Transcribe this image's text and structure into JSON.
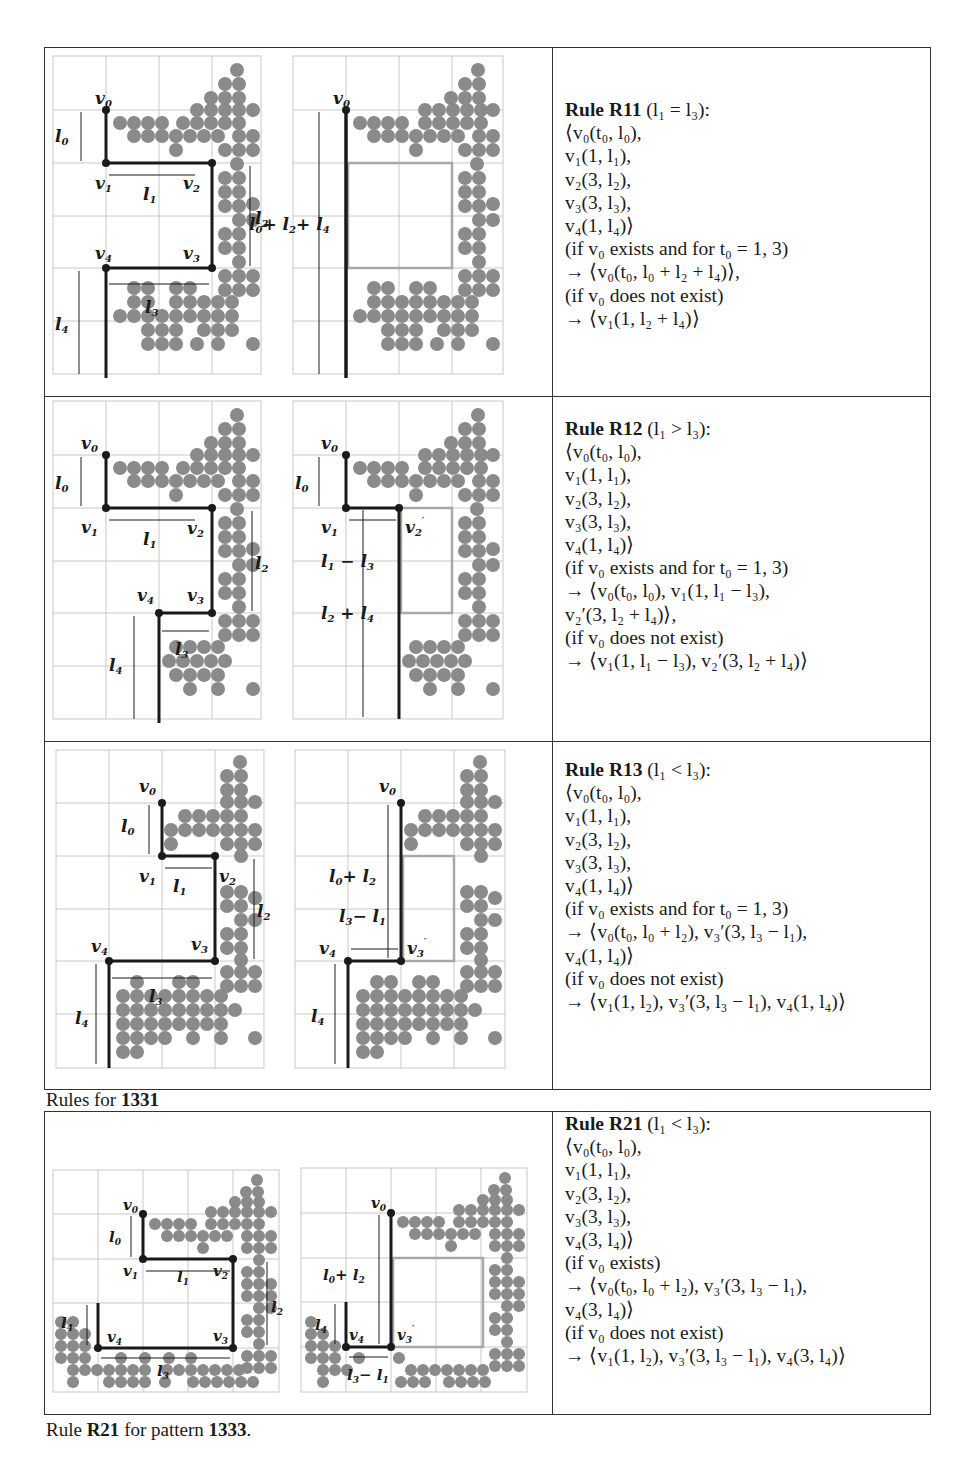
{
  "table1": {
    "caption_prefix": "Rules for ",
    "caption_pattern": "1331",
    "rows": [
      {
        "rule_name": "Rule R11",
        "condition": "(l₁ = l₃):",
        "lines": [
          "⟨v₀(t₀, l₀),",
          "v₁(1, l₁),",
          "v₂(3, l₂),",
          "v₃(3, l₃),",
          "v₄(1, l₄)⟩",
          "(if v₀ exists and for t₀ = 1, 3)",
          "→ ⟨v₀(t₀, l₀ + l₂ + l₄)⟩,",
          "(if v₀ does not exist)",
          "→ ⟨v₁(1, l₂ + l₄)⟩"
        ],
        "figure_left_labels": [
          "v0",
          "l0",
          "v1",
          "l1",
          "v2",
          "l2",
          "v3",
          "v4",
          "l3",
          "l4"
        ],
        "figure_right_labels": [
          "v0",
          "l0+l2+l4"
        ]
      },
      {
        "rule_name": "Rule R12",
        "condition": "(l₁ > l₃):",
        "lines": [
          "⟨v₀(t₀, l₀),",
          "v₁(1, l₁),",
          "v₂(3, l₂),",
          "v₃(3, l₃),",
          "v₄(1, l₄)⟩",
          "(if v₀ exists and for t₀ = 1, 3)",
          "→ ⟨v₀(t₀, l₀), v₁(1, l₁ − l₃),",
          "v₂′(3, l₂ + l₄)⟩,",
          "(if v₀ does not exist)",
          "→ ⟨v₁(1, l₁ − l₃), v₂′(3, l₂ + l₄)⟩"
        ],
        "figure_left_labels": [
          "v0",
          "l0",
          "v1",
          "l1",
          "v2",
          "l2",
          "v4",
          "v3",
          "l3",
          "l4"
        ],
        "figure_right_labels": [
          "v0",
          "l0",
          "v1",
          "v2'",
          "l1 − l3",
          "l2 + l4"
        ]
      },
      {
        "rule_name": "Rule R13",
        "condition": "(l₁ < l₃):",
        "lines": [
          "⟨v₀(t₀, l₀),",
          "v₁(1, l₁),",
          "v₂(3, l₂),",
          "v₃(3, l₃),",
          "v₄(1, l₄)⟩",
          "(if v₀ exists and for t₀ = 1, 3)",
          "→ ⟨v₀(t₀, l₀ + l₂), v₃′(3, l₃ − l₁),",
          "v₄(1, l₄)⟩",
          "(if v₀ does not exist)",
          "→ ⟨v₁(1, l₂), v₃′(3, l₃ − l₁), v₄(1, l₄)⟩"
        ],
        "figure_left_labels": [
          "v0",
          "l0",
          "v1",
          "l1",
          "v2",
          "l2",
          "v3",
          "v4",
          "l3",
          "l4"
        ],
        "figure_right_labels": [
          "v0",
          "l0+ l2",
          "l3− l1",
          "v4",
          "v3'",
          "l4"
        ]
      }
    ]
  },
  "table2": {
    "caption_prefix": "Rule ",
    "caption_rule": "R21",
    "caption_mid": " for pattern ",
    "caption_pattern": "1333",
    "caption_suffix": ".",
    "row": {
      "rule_name": "Rule R21",
      "condition": "(l₁ < l₃):",
      "lines": [
        "⟨v₀(t₀, l₀),",
        "v₁(1, l₁),",
        "v₂(3, l₂),",
        "v₃(3, l₃),",
        "v₄(3, l₄)⟩",
        "(if v₀ exists)",
        "→ ⟨v₀(t₀, l₀ + l₂), v₃′(3, l₃ − l₁),",
        "v₄(3, l₄)⟩",
        "(if v₀ does not exist)",
        "→ ⟨v₁(1, l₂), v₃′(3, l₃ − l₁), v₄(3, l₄)⟩"
      ],
      "figure_left_labels": [
        "v0",
        "l0",
        "v1",
        "l1",
        "v2",
        "l2",
        "l4",
        "v4",
        "v3",
        "l3"
      ],
      "figure_right_labels": [
        "v0",
        "l0+ l2",
        "l4",
        "v4",
        "v3'",
        "l3− l1"
      ]
    }
  },
  "colors": {
    "dot": "#8a8a8a",
    "path": "#1a1a1a",
    "grid": "#c8c8c8",
    "ghost_box": "#a8a8a8",
    "border": "#333333"
  }
}
